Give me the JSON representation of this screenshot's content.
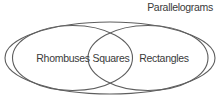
{
  "diagram": {
    "type": "venn",
    "title": "Parallelograms",
    "sets": {
      "left": {
        "label": "Rhombuses"
      },
      "intersection": {
        "label": "Squares"
      },
      "right": {
        "label": "Rectangles"
      }
    }
  },
  "colors": {
    "line": "#5e5e5e",
    "text": "#3a3a3a",
    "background": "#ffffff"
  }
}
